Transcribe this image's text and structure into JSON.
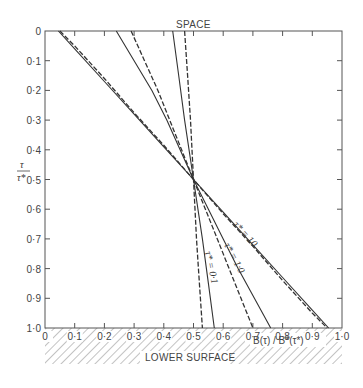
{
  "chart_data": {
    "type": "line",
    "title": "",
    "top_label": "SPACE",
    "bottom_label": "LOWER SURFACE",
    "xlabel": "B(τ) / B*(τ*)",
    "ylabel_num": "τ",
    "ylabel_den": "τ*",
    "xlim": [
      0,
      1.0
    ],
    "ylim": [
      1.0,
      0
    ],
    "y_inverted": true,
    "grid": false,
    "xticks": [
      "0",
      "0·1",
      "0·2",
      "0·3",
      "0·4",
      "0·5",
      "0·6",
      "0·7",
      "0·8",
      "0·9",
      "1·0"
    ],
    "yticks": [
      "0",
      "0·1",
      "0·2",
      "0·3",
      "0·4",
      "0·5",
      "0·6",
      "0·7",
      "0·8",
      "0·9",
      "1·0"
    ],
    "series": [
      {
        "name": "τ* = 10 (solid)",
        "style": "solid",
        "points": [
          [
            0.045,
            0.0
          ],
          [
            0.1,
            0.06
          ],
          [
            0.2,
            0.17
          ],
          [
            0.3,
            0.28
          ],
          [
            0.4,
            0.39
          ],
          [
            0.5,
            0.5
          ],
          [
            0.6,
            0.61
          ],
          [
            0.7,
            0.72
          ],
          [
            0.8,
            0.83
          ],
          [
            0.9,
            0.94
          ],
          [
            0.955,
            1.0
          ]
        ]
      },
      {
        "name": "τ* = 10 (dashed)",
        "style": "dashed",
        "points": [
          [
            0.05,
            0.0
          ],
          [
            0.1,
            0.05
          ],
          [
            0.2,
            0.16
          ],
          [
            0.3,
            0.275
          ],
          [
            0.4,
            0.385
          ],
          [
            0.5,
            0.5
          ],
          [
            0.6,
            0.615
          ],
          [
            0.7,
            0.725
          ],
          [
            0.8,
            0.84
          ],
          [
            0.9,
            0.95
          ],
          [
            0.95,
            1.0
          ]
        ]
      },
      {
        "name": "τ* = 1·0 (solid)",
        "style": "solid",
        "points": [
          [
            0.24,
            0.0
          ],
          [
            0.3,
            0.1
          ],
          [
            0.36,
            0.2
          ],
          [
            0.41,
            0.3
          ],
          [
            0.455,
            0.4
          ],
          [
            0.5,
            0.5
          ],
          [
            0.55,
            0.6
          ],
          [
            0.6,
            0.7
          ],
          [
            0.65,
            0.8
          ],
          [
            0.705,
            0.9
          ],
          [
            0.76,
            1.0
          ]
        ]
      },
      {
        "name": "τ* = 1·0 (dashed)",
        "style": "dashed",
        "points": [
          [
            0.29,
            0.0
          ],
          [
            0.335,
            0.1
          ],
          [
            0.38,
            0.2
          ],
          [
            0.42,
            0.3
          ],
          [
            0.46,
            0.4
          ],
          [
            0.5,
            0.5
          ],
          [
            0.54,
            0.6
          ],
          [
            0.58,
            0.7
          ],
          [
            0.62,
            0.8
          ],
          [
            0.66,
            0.9
          ],
          [
            0.7,
            1.0
          ]
        ]
      },
      {
        "name": "τ* = 0·1 (solid)",
        "style": "solid",
        "points": [
          [
            0.43,
            0.0
          ],
          [
            0.45,
            0.15
          ],
          [
            0.47,
            0.3
          ],
          [
            0.5,
            0.5
          ],
          [
            0.53,
            0.7
          ],
          [
            0.55,
            0.85
          ],
          [
            0.57,
            1.0
          ]
        ]
      },
      {
        "name": "τ* = 0·1 (dashed)",
        "style": "dashed",
        "points": [
          [
            0.47,
            0.0
          ],
          [
            0.48,
            0.15
          ],
          [
            0.49,
            0.3
          ],
          [
            0.5,
            0.5
          ],
          [
            0.51,
            0.7
          ],
          [
            0.52,
            0.85
          ],
          [
            0.53,
            1.0
          ]
        ]
      }
    ],
    "annotations": [
      {
        "text": "τ* = 10",
        "near": [
          0.78,
          0.66
        ]
      },
      {
        "text": "τ* = 1·0",
        "near": [
          0.64,
          0.74
        ]
      },
      {
        "text": "τ* = 0·1",
        "near": [
          0.55,
          0.78
        ]
      }
    ],
    "legend": "none (inline curve labels)"
  },
  "labels": {
    "space": "SPACE",
    "lower_surface": "LOWER SURFACE",
    "xlabel": "B(τ) / B*(τ*)",
    "ylabel_num": "τ",
    "ylabel_den": "τ*",
    "curve_10": "τ* = 10",
    "curve_1": "τ* = 1·0",
    "curve_01": "τ* = 0·1"
  }
}
